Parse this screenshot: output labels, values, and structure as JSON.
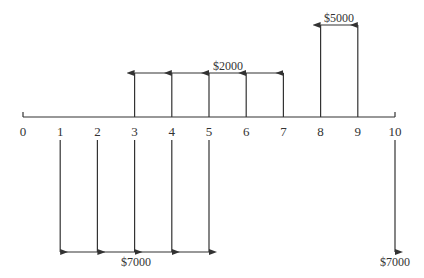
{
  "chart_data": {
    "type": "cash_flow_diagram",
    "title": "",
    "axis": {
      "periods": [
        0,
        1,
        2,
        3,
        4,
        5,
        6,
        7,
        8,
        9,
        10
      ],
      "tick_labels": [
        "0",
        "1",
        "2",
        "3",
        "4",
        "5",
        "6",
        "7",
        "8",
        "9",
        "10"
      ]
    },
    "inflows": [
      {
        "periods": [
          3,
          4,
          5,
          6,
          7
        ],
        "amount": 2000,
        "label": "$2000"
      },
      {
        "periods": [
          8,
          9
        ],
        "amount": 5000,
        "label": "$5000"
      }
    ],
    "outflows": [
      {
        "periods": [
          1,
          2,
          3,
          4,
          5
        ],
        "amount": 7000,
        "label": "$7000"
      },
      {
        "periods": [
          10
        ],
        "amount": 7000,
        "label": "$7000"
      }
    ]
  },
  "labels": {
    "tick": [
      "0",
      "1",
      "2",
      "3",
      "4",
      "5",
      "6",
      "7",
      "8",
      "9",
      "10"
    ],
    "inflow_2000": "$2000",
    "inflow_5000": "$5000",
    "outflow_group": "$7000",
    "outflow_single": "$7000"
  },
  "colors": {
    "line": "#333333"
  }
}
